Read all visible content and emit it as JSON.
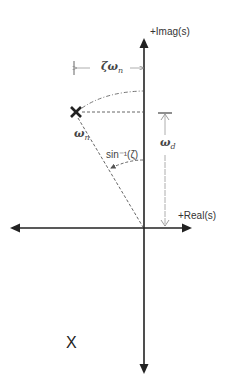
{
  "diagram": {
    "type": "s-plane pole-zero diagram",
    "axes": {
      "imag_label": "+Imag(s)",
      "real_label": "+Real(s)"
    },
    "annotations": {
      "zeta_omega_n": {
        "symbol": "ζω",
        "sub": "n"
      },
      "omega_n": {
        "symbol": "ω",
        "sub": "n"
      },
      "omega_d": {
        "symbol": "ω",
        "sub": "d"
      },
      "angle": "sin⁻¹(ζ)"
    },
    "poles": [
      {
        "name": "upper-pole",
        "glyph": "✕",
        "x": 76,
        "y": 112
      },
      {
        "name": "lower-pole",
        "glyph": "X",
        "x": 72,
        "y": 343
      }
    ],
    "colors": {
      "axis": "#222222",
      "dashed": "#555555",
      "arrow_light": "#888888"
    }
  }
}
